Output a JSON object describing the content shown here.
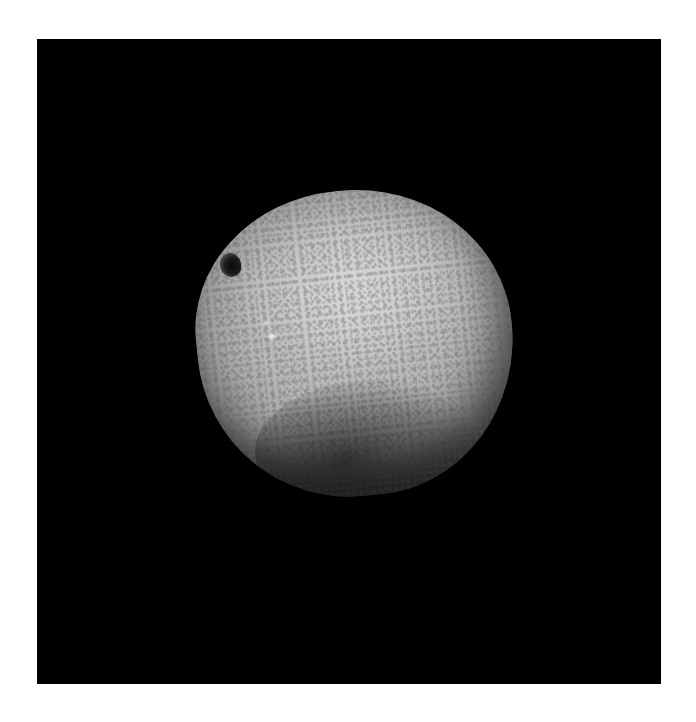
{
  "image": {
    "description": "Photograph of a pale grey speckled stone apple with a stem cavity, on a black background",
    "subject": "stone apple",
    "colors": {
      "page_background": "#ffffff",
      "photo_background": "#000000",
      "stone_light": "#c9c9c9",
      "stone_mid": "#9b9b9b",
      "stone_shadow": "#1e1e1e",
      "stem_cavity": "#0a0a0a"
    }
  }
}
